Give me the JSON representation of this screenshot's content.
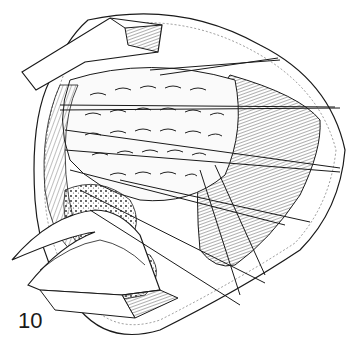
{
  "figure": {
    "label": "10",
    "colors": {
      "ink": "#1a1a1a",
      "background": "#ffffff"
    }
  }
}
